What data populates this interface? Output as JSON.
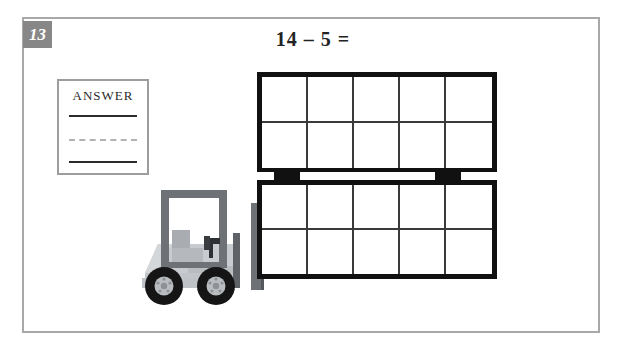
{
  "worksheet": {
    "problem_number": "13",
    "equation": "14 – 5 =",
    "answer_box": {
      "label": "ANSWER",
      "lines": [
        "solid",
        "dashed",
        "solid"
      ]
    }
  },
  "ten_frames": [
    {
      "name": "top-ten-frame",
      "rows": 2,
      "columns": 5,
      "total_cells": 10,
      "filled_cells": 0
    },
    {
      "name": "bottom-ten-frame",
      "rows": 2,
      "columns": 5,
      "total_cells": 10,
      "filled_cells": 0
    }
  ],
  "illustration": {
    "vehicle": "forklift",
    "pallet_blocks": 2
  },
  "colors": {
    "badge_bg": "#878787",
    "badge_text": "#ffffff",
    "sheet_border": "#a8a8a8",
    "frame_border": "#111111",
    "cell_line": "#3a3a3a",
    "answer_border": "#9d9d9d",
    "answer_solid_line": "#2b2b2b",
    "answer_dashed_line": "#b2b2b2",
    "forklift_body": "#c8cbcf",
    "forklift_dark": "#6e7276",
    "tire": "#151515",
    "hub": "#b9bcc0"
  }
}
